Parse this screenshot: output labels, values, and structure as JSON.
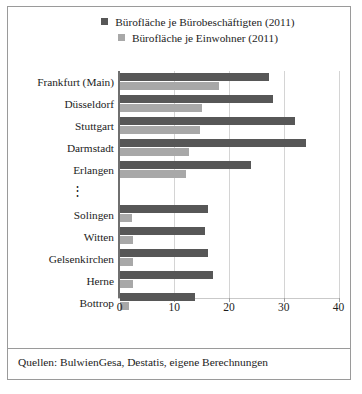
{
  "chart_data": {
    "type": "bar",
    "orientation": "horizontal",
    "title": "",
    "subtitle": "",
    "xlabel": "",
    "ylabel": "",
    "xlim": [
      0,
      40
    ],
    "xticks": [
      0,
      10,
      20,
      30,
      40
    ],
    "xtick_labels": [
      "0",
      "10",
      "20",
      "30",
      "40"
    ],
    "grid": true,
    "grid_axis": "x",
    "legend_position": "top",
    "categories": [
      "Frankfurt (Main)",
      "Düsseldorf",
      "Stuttgart",
      "Darmstadt",
      "Erlangen",
      "⋮",
      "Solingen",
      "Witten",
      "Gelsenkirchen",
      "Herne",
      "Bottrop"
    ],
    "series": [
      {
        "name": "Bürofläche je Bürobeschäftigten (2011)",
        "color": "#575757",
        "values": [
          27.3,
          28.0,
          32.0,
          34.0,
          24.0,
          null,
          16.2,
          15.6,
          16.2,
          17.0,
          13.7
        ]
      },
      {
        "name": "Bürofläche je Einwohner (2011)",
        "color": "#a8a8a8",
        "values": [
          18.2,
          15.1,
          14.7,
          12.7,
          12.2,
          null,
          2.2,
          2.4,
          2.4,
          2.4,
          1.7
        ]
      }
    ]
  },
  "legend": {
    "items": [
      {
        "label": "Bürofläche je Bürobeschäftigten (2011)",
        "color": "#575757"
      },
      {
        "label": "Bürofläche je Einwohner (2011)",
        "color": "#a8a8a8"
      }
    ]
  },
  "source": {
    "text": "Quellen: BulwienGesa, Destatis, eigene Berechnungen"
  },
  "colors": {
    "series_dark": "#575757",
    "series_light": "#a8a8a8",
    "frame": "#9a9a9a",
    "gridline": "#d4d4d4",
    "axis": "#6f6f6f",
    "text": "#1c1c1c",
    "background": "#ffffff"
  }
}
